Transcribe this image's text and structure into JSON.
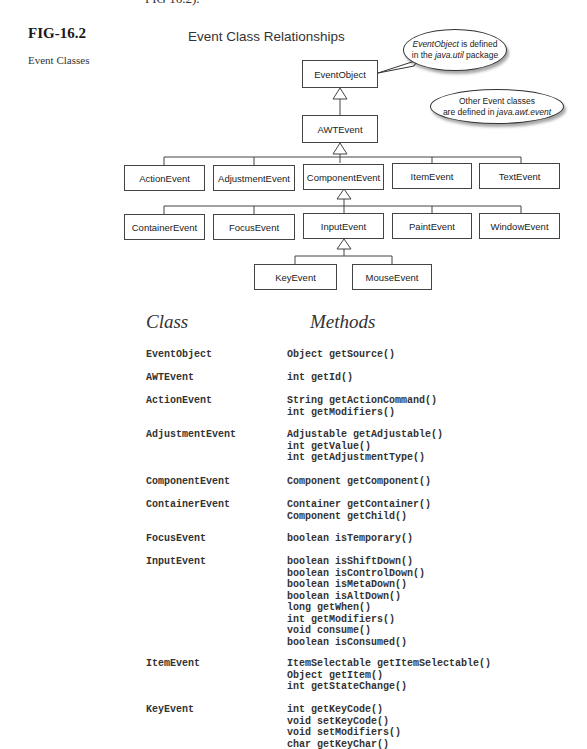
{
  "page": {
    "top_cut_text": "FIG 16.2).",
    "figure_number": "FIG-16.2",
    "figure_caption": "Event Classes"
  },
  "diagram": {
    "title": "Event Class Relationships",
    "callouts": {
      "event_object": {
        "italic": "EventObject",
        "line1_rest": " is defined",
        "line2_pre": "in the ",
        "line2_italic": "java.util",
        "line2_post": " package"
      },
      "other_events": {
        "line1": "Other Event classes",
        "line2_pre": "are defined in ",
        "line2_italic": "java.awt.event"
      }
    },
    "nodes": {
      "event_object": "EventObject",
      "awt_event": "AWTEvent",
      "action_event": "ActionEvent",
      "adjustment_event": "AdjustmentEvent",
      "component_event": "ComponentEvent",
      "item_event": "ItemEvent",
      "text_event": "TextEvent",
      "container_event": "ContainerEvent",
      "focus_event": "FocusEvent",
      "input_event": "InputEvent",
      "paint_event": "PaintEvent",
      "window_event": "WindowEvent",
      "key_event": "KeyEvent",
      "mouse_event": "MouseEvent"
    },
    "edges": [
      {
        "child": "AWTEvent",
        "parent": "EventObject"
      },
      {
        "child": "ActionEvent",
        "parent": "AWTEvent"
      },
      {
        "child": "AdjustmentEvent",
        "parent": "AWTEvent"
      },
      {
        "child": "ComponentEvent",
        "parent": "AWTEvent"
      },
      {
        "child": "ItemEvent",
        "parent": "AWTEvent"
      },
      {
        "child": "TextEvent",
        "parent": "AWTEvent"
      },
      {
        "child": "ContainerEvent",
        "parent": "ComponentEvent"
      },
      {
        "child": "FocusEvent",
        "parent": "ComponentEvent"
      },
      {
        "child": "InputEvent",
        "parent": "ComponentEvent"
      },
      {
        "child": "PaintEvent",
        "parent": "ComponentEvent"
      },
      {
        "child": "WindowEvent",
        "parent": "ComponentEvent"
      },
      {
        "child": "KeyEvent",
        "parent": "InputEvent"
      },
      {
        "child": "MouseEvent",
        "parent": "InputEvent"
      }
    ]
  },
  "table": {
    "headers": {
      "class": "Class",
      "methods": "Methods"
    },
    "rows": [
      {
        "class": "EventObject",
        "methods": [
          "Object getSource()"
        ]
      },
      {
        "class": "AWTEvent",
        "methods": [
          "int getId()"
        ]
      },
      {
        "class": "ActionEvent",
        "methods": [
          "String getActionCommand()",
          "int getModifiers()"
        ]
      },
      {
        "class": "AdjustmentEvent",
        "methods": [
          "Adjustable getAdjustable()",
          "int getValue()",
          "int getAdjustmentType()"
        ]
      },
      {
        "class": "ComponentEvent",
        "methods": [
          "Component getComponent()"
        ]
      },
      {
        "class": "ContainerEvent",
        "methods": [
          "Container getContainer()",
          "Component getChild()"
        ]
      },
      {
        "class": "FocusEvent",
        "methods": [
          "boolean isTemporary()"
        ]
      },
      {
        "class": "InputEvent",
        "methods": [
          "boolean isShiftDown()",
          "boolean isControlDown()",
          "boolean isMetaDown()",
          "boolean isAltDown()",
          "long getWhen()",
          "int getModifiers()",
          "void consume()",
          "boolean isConsumed()"
        ]
      },
      {
        "class": "ItemEvent",
        "methods": [
          "ItemSelectable getItemSelectable()",
          "Object getItem()",
          "int getStateChange()"
        ]
      },
      {
        "class": "KeyEvent",
        "methods": [
          "int getKeyCode()",
          "void setKeyCode()",
          "void setModifiers()",
          "char getKeyChar()"
        ]
      }
    ]
  }
}
